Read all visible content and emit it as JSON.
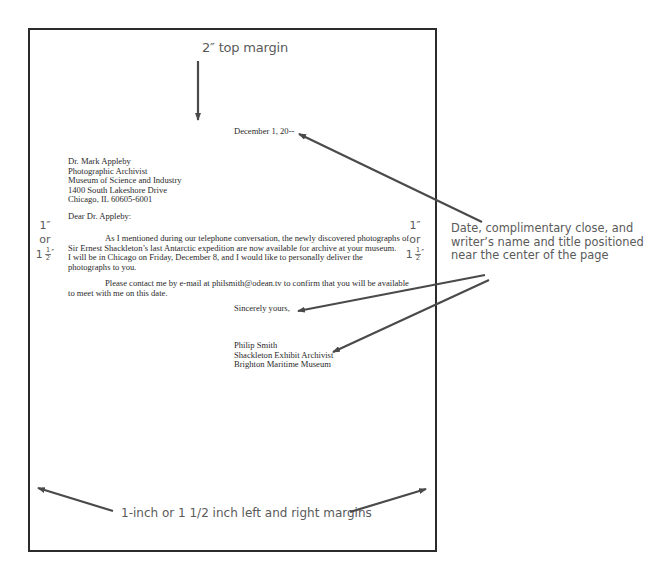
{
  "annotations": {
    "top_margin": "2″ top margin",
    "left_margin": {
      "line1": "1″",
      "line2": "or",
      "whole": "1",
      "num": "1",
      "den": "2",
      "unit": "″"
    },
    "right_margin": {
      "line1": "1″",
      "line2": "or",
      "whole": "1",
      "num": "1",
      "den": "2",
      "unit": "″"
    },
    "center_note": {
      "lines": [
        "Date, complimentary close, and",
        "writer’s name and title positioned",
        "near the center of the page"
      ]
    },
    "side_margins": "1-inch or 1 1/2 inch left and right margins"
  },
  "letter": {
    "date": "December 1, 20--",
    "inside_address": [
      "Dr. Mark Appleby",
      "Photographic Archivist",
      "Museum of Science and Industry",
      "1400 South Lakeshore Drive",
      "Chicago, IL 60605-6001"
    ],
    "salutation": "Dear Dr. Appleby:",
    "paragraph1": [
      "As I mentioned during our telephone conversation, the newly discovered photographs of",
      "Sir Ernest Shackleton’s last Antarctic expedition are now available for archive at your museum.",
      "I will be in Chicago on Friday, December 8, and I would like to personally deliver the",
      "photographs to you."
    ],
    "paragraph2": [
      "Please contact me by e-mail at philsmith@odean.tv to confirm that you will be available",
      "to meet with me on this date."
    ],
    "complimentary_close": "Sincerely yours,",
    "signature": [
      "Philip Smith",
      "Shackleton Exhibit Archivist",
      "Brighton Maritime Museum"
    ]
  },
  "colors": {
    "page_border": "#2b2b2b",
    "arrow": "#4a4a4a",
    "annotation_text": "#5a5a5a",
    "letter_text": "#2a2a2a"
  }
}
